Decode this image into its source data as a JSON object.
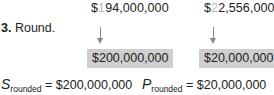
{
  "top_values": [
    {
      "prefix": "$",
      "highlight": "1",
      "rest": "94,000,000"
    },
    {
      "prefix": "$",
      "highlight": "2",
      "rest": "2,556,000"
    }
  ],
  "step": {
    "number": "3.",
    "label": "Round."
  },
  "rounded_boxes": [
    "$200,000,000",
    "$20,000,000"
  ],
  "equations": [
    {
      "variable": "S",
      "subscript": "rounded",
      "equals": " = ",
      "value": "$200,000,000"
    },
    {
      "variable": "P",
      "subscript": "rounded",
      "equals": " = ",
      "value": "$20,000,000"
    }
  ],
  "colors": {
    "text": "#222222",
    "highlight_digit": "#b9b9b9",
    "box_fill": "#cfcfcf",
    "arrow": "#8a8a8a"
  }
}
